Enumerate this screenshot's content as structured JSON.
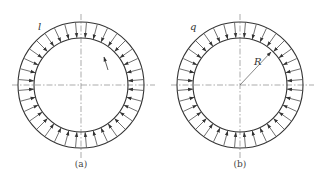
{
  "figure": {
    "panels": [
      {
        "id": "a",
        "caption": "(a)",
        "load_label": "l",
        "center": [
          81,
          85
        ],
        "outer_radius": 63,
        "inner_radius": 47,
        "arrow_count": 36,
        "has_radius_marker": false,
        "has_small_arrow": true
      },
      {
        "id": "b",
        "caption": "(b)",
        "load_label": "q",
        "radius_label": "R",
        "center": [
          240,
          85
        ],
        "outer_radius": 63,
        "inner_radius": 47,
        "arrow_count": 36,
        "has_radius_marker": true,
        "has_small_arrow": false
      }
    ],
    "colors": {
      "stroke": "#333333",
      "centerline": "#888888"
    }
  }
}
